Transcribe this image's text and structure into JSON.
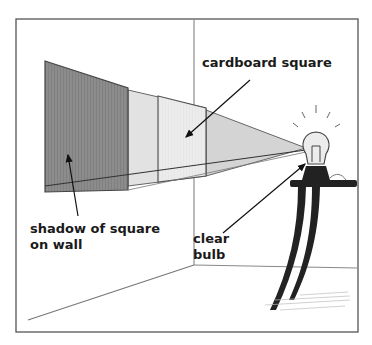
{
  "figure": {
    "labels": {
      "cardboard": "cardboard square",
      "shadow_line1": "shadow of square",
      "shadow_line2": "on wall",
      "bulb_line1": "clear",
      "bulb_line2": "bulb"
    },
    "colors": {
      "frame": "#555555",
      "shadow": "#8a8a8a",
      "light_cone": "#d2d2d2",
      "cardboard": "#e8e8e8",
      "table": "#222222",
      "ink": "#1a1a1a"
    }
  }
}
